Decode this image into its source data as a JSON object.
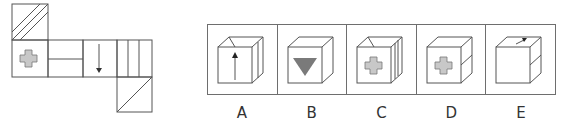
{
  "net": {
    "faces": [
      "hatched-top",
      "gray-cross",
      "horizontal-split",
      "down-arrow",
      "vertical-stripes",
      "diagonal-bottom"
    ]
  },
  "options": [
    {
      "label": "A",
      "front": "up-arrow",
      "top": "roof-lines",
      "side": "blank"
    },
    {
      "label": "B",
      "front": "gray-triangle",
      "top": "blank",
      "side": "blank"
    },
    {
      "label": "C",
      "front": "gray-cross",
      "top": "roof-lines",
      "side": "vertical-stripes"
    },
    {
      "label": "D",
      "front": "gray-cross",
      "top": "blank",
      "side": "horizontal-split"
    },
    {
      "label": "E",
      "front": "blank",
      "top": "arrow",
      "side": "horizontal-split"
    }
  ],
  "colors": {
    "line": "#555555",
    "fill_gray": "#c8c8c8",
    "triangle": "#7a7a7a"
  }
}
